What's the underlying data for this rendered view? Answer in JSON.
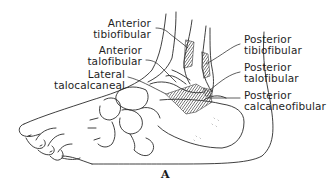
{
  "figure": {
    "panel_label": "A",
    "colors": {
      "line": "#2a2a2a",
      "background": "#ffffff",
      "ligament_hatch": "#3a3a3a"
    },
    "labels_left": [
      {
        "id": "anterior-tibiofibular",
        "line1": "Anterior",
        "line2": "tibiofibular"
      },
      {
        "id": "anterior-talofibular",
        "line1": "Anterior",
        "line2": "talofibular"
      },
      {
        "id": "lateral-talocalcaneal",
        "line1": "Lateral",
        "line2": "talocalcaneal"
      }
    ],
    "labels_right": [
      {
        "id": "posterior-tibiofibular",
        "line1": "Posterior",
        "line2": "tibiofibular"
      },
      {
        "id": "posterior-talofibular",
        "line1": "Posterior",
        "line2": "talofibular"
      },
      {
        "id": "posterior-calcaneofibular",
        "line1": "Posterior",
        "line2": "calcaneofibular"
      }
    ]
  }
}
